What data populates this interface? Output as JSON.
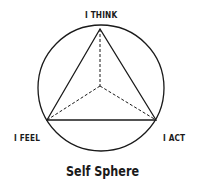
{
  "diagram": {
    "title": "Self Sphere",
    "nodes": {
      "top": "I THINK",
      "left": "I FEEL",
      "right": "I ACT"
    },
    "colors": {
      "stroke": "#1a1a1a",
      "background": "#ffffff"
    }
  }
}
